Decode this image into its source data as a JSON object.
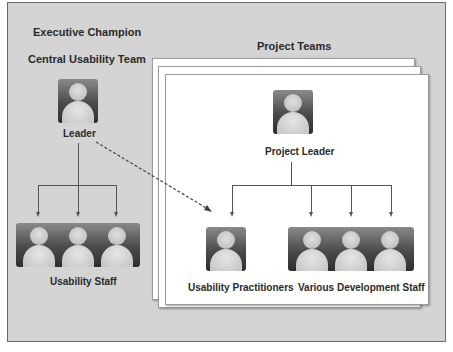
{
  "diagram": {
    "executive_label": "Executive Champion",
    "central_team_label": "Central Usability Team",
    "project_teams_label": "Project Teams",
    "central": {
      "leader_label": "Leader",
      "staff_label": "Usability Staff",
      "staff_count": 3
    },
    "project": {
      "leader_label": "Project Leader",
      "practitioners_label": "Usability Practitioners",
      "dev_staff_label": "Various Development Staff",
      "dev_staff_count": 3
    },
    "connectors": [
      {
        "from": "Leader",
        "to": "Usability Staff",
        "style": "solid",
        "arrows": 3
      },
      {
        "from": "Project Leader",
        "to": "Usability Practitioners",
        "style": "solid"
      },
      {
        "from": "Project Leader",
        "to": "Various Development Staff",
        "style": "solid",
        "arrows": 3
      },
      {
        "from": "Leader",
        "to": "Usability Practitioners",
        "style": "dashed"
      }
    ],
    "colors": {
      "background": "#d4d4d4",
      "sheet": "#ffffff",
      "text": "#2a2a2a",
      "lines": "#555555"
    }
  }
}
